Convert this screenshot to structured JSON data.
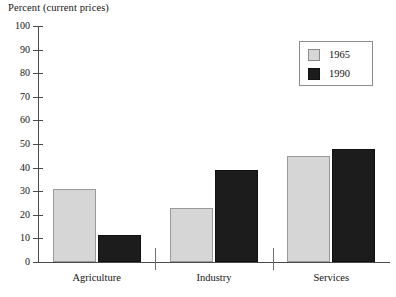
{
  "chart_data": {
    "type": "bar",
    "title": "Percent (current prices)",
    "xlabel": "",
    "ylabel": "",
    "ylim": [
      0,
      100
    ],
    "ytick_step": 10,
    "yticks": [
      100,
      90,
      80,
      70,
      60,
      50,
      40,
      30,
      20,
      10,
      0
    ],
    "ytick_labels": [
      "100",
      "90",
      "80",
      "70",
      "60",
      "50",
      "40",
      "30",
      "20",
      "10",
      "0"
    ],
    "grid": false,
    "legend_position": "top-right",
    "categories": [
      "Agriculture",
      "Industry",
      "Services"
    ],
    "series": [
      {
        "name": "1965",
        "color": "#d6d6d6",
        "values": [
          31,
          23,
          45
        ]
      },
      {
        "name": "1990",
        "color": "#1c1c1c",
        "values": [
          11.5,
          39,
          48
        ]
      }
    ]
  },
  "legend": {
    "entries": [
      {
        "label": "1965"
      },
      {
        "label": "1990"
      }
    ]
  },
  "colors": {
    "series_1965": "#d6d6d6",
    "series_1990": "#1c1c1c",
    "axis": "#4a4a4a",
    "text": "#141414",
    "background": "#ffffff"
  }
}
